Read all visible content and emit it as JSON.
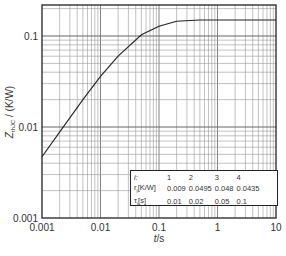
{
  "chart_data": {
    "type": "line",
    "title": "",
    "xlabel": "t/s",
    "ylabel": "Z_thJC / (K/W)",
    "xscale": "log",
    "yscale": "log",
    "xlim": [
      0.001,
      10
    ],
    "ylim": [
      0.001,
      0.22
    ],
    "grid": true,
    "x_ticks": [
      "0.001",
      "0.01",
      "0.1",
      "1",
      "10"
    ],
    "y_ticks": [
      "0.001",
      "0.01",
      "0.1"
    ],
    "series": [
      {
        "name": "Z_thJC",
        "x": [
          0.001,
          0.002,
          0.005,
          0.01,
          0.02,
          0.05,
          0.1,
          0.2,
          0.5,
          1,
          2,
          5,
          10
        ],
        "y": [
          0.0047,
          0.0088,
          0.02,
          0.036,
          0.06,
          0.103,
          0.128,
          0.145,
          0.15,
          0.15,
          0.15,
          0.15,
          0.15
        ]
      }
    ],
    "legend_table": {
      "header_label": "i:",
      "columns": [
        "1",
        "2",
        "3",
        "4"
      ],
      "rows": [
        {
          "label": "r_i[K/W]",
          "values": [
            "0.009",
            "0.0495",
            "0.048",
            "0.0435"
          ]
        },
        {
          "label": "τ_i[s]",
          "values": [
            "0.01",
            "0.02",
            "0.05",
            "0.1"
          ]
        }
      ],
      "position": "lower right"
    }
  },
  "axes": {
    "xlabel": "t/s",
    "ylabel": "Z",
    "ylabel_sub": "thJC",
    "ylabel_unit": " / (K/W)"
  },
  "legend": {
    "header": "i:",
    "c1": "1",
    "c2": "2",
    "c3": "3",
    "c4": "4",
    "r_label": "r",
    "r_sub": "i",
    "r_unit": "[K/W]",
    "r1": "0.009",
    "r2": "0.0495",
    "r3": "0.048",
    "r4": "0.0435",
    "t_label": "τ",
    "t_sub": "i",
    "t_unit": "[s]",
    "t1": "0.01",
    "t2": "0.02",
    "t3": "0.05",
    "t4": "0.1"
  }
}
